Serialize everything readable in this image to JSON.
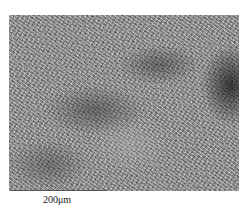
{
  "figure": {
    "type": "micrograph",
    "scale_bar": {
      "label": "200μm",
      "color": "#555555"
    }
  }
}
